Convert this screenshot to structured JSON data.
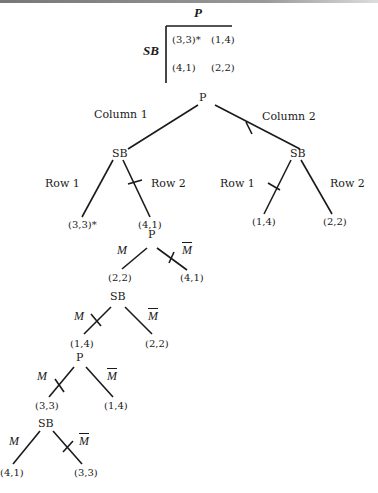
{
  "matrix": {
    "column_player": "P",
    "row_player": "SB",
    "cells": [
      [
        "(3,3)*",
        "(1,4)"
      ],
      [
        "(4,1)",
        "(2,2)"
      ]
    ]
  },
  "tree": {
    "root": "P",
    "level1": {
      "left_edge": "Column 1",
      "right_edge": "Column 2",
      "left_node": "SB",
      "right_node": "SB"
    },
    "level2": {
      "left_row1": "Row 1",
      "left_row2": "Row 2",
      "right_row1": "Row 1",
      "right_row2": "Row 2",
      "leaf_left_row1": "(3,3)*",
      "leaf_left_row2": "(4,1)",
      "leaf_right_row1": "(1,4)",
      "leaf_right_row2": "(2,2)"
    },
    "sub1": {
      "node": "P",
      "m": "M",
      "mbar": "M",
      "left": "(2,2)",
      "right": "(4,1)"
    },
    "sub2": {
      "node": "SB",
      "m": "M",
      "mbar": "M",
      "left": "(1,4)",
      "right": "(2,2)"
    },
    "sub3": {
      "node": "P",
      "m": "M",
      "mbar": "M",
      "left": "(3,3)",
      "right": "(1,4)"
    },
    "sub4": {
      "node": "SB",
      "m": "M",
      "mbar": "M",
      "left": "(4,1)",
      "right": "(3,3)"
    }
  }
}
